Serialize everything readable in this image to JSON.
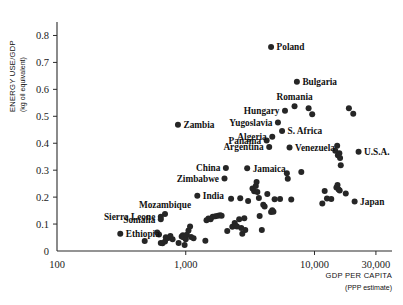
{
  "chart_data": {
    "type": "scatter",
    "title": "",
    "xlabel": "GDP PER CAPITA",
    "xlabel_sub": "(PPP estimate)",
    "ylabel": "ENERGY USE/GDP",
    "ylabel_sub": "(kg oil equivalent)",
    "xscale": "log",
    "yscale": "linear",
    "xlim": [
      100,
      40000
    ],
    "ylim": [
      0,
      0.85
    ],
    "grid": false,
    "legend": "none",
    "xticks": [
      {
        "value": 100,
        "label": "100"
      },
      {
        "value": 1000,
        "label": "1,000"
      },
      {
        "value": 10000,
        "label": "10,000"
      },
      {
        "value": 30000,
        "label": "30,000"
      }
    ],
    "yticks": [
      {
        "value": 0,
        "label": "0"
      },
      {
        "value": 0.1,
        "label": "0.1"
      },
      {
        "value": 0.2,
        "label": "0.2"
      },
      {
        "value": 0.3,
        "label": "0.3"
      },
      {
        "value": 0.4,
        "label": "0.4"
      },
      {
        "value": 0.5,
        "label": "0.5"
      },
      {
        "value": 0.6,
        "label": "0.6"
      },
      {
        "value": 0.7,
        "label": "0.7"
      },
      {
        "value": 0.8,
        "label": "0.8"
      }
    ],
    "marker_color": "#262626",
    "marker_size": 3.0,
    "labeled_points": [
      {
        "name": "Poland",
        "x": 4600,
        "y": 0.757,
        "label_side": "right"
      },
      {
        "name": "Bulgaria",
        "x": 7300,
        "y": 0.628,
        "label_side": "right"
      },
      {
        "name": "Romania",
        "x": 7000,
        "y": 0.537,
        "label_side": "above"
      },
      {
        "name": "Hungary",
        "x": 5900,
        "y": 0.521,
        "label_side": "left"
      },
      {
        "name": "Yugoslavia",
        "x": 5200,
        "y": 0.477,
        "label_side": "left"
      },
      {
        "name": "S. Africa",
        "x": 5600,
        "y": 0.445,
        "label_side": "right"
      },
      {
        "name": "Algeria",
        "x": 4700,
        "y": 0.424,
        "label_side": "left"
      },
      {
        "name": "Panama",
        "x": 4250,
        "y": 0.41,
        "label_side": "left"
      },
      {
        "name": "Argentina",
        "x": 4450,
        "y": 0.386,
        "label_side": "left"
      },
      {
        "name": "Venezuela",
        "x": 6400,
        "y": 0.384,
        "label_side": "right"
      },
      {
        "name": "U.S.A.",
        "x": 22000,
        "y": 0.368,
        "label_side": "right"
      },
      {
        "name": "Zambia",
        "x": 870,
        "y": 0.469,
        "label_side": "right"
      },
      {
        "name": "China",
        "x": 2050,
        "y": 0.308,
        "label_side": "left"
      },
      {
        "name": "Jamaica",
        "x": 3000,
        "y": 0.307,
        "label_side": "right"
      },
      {
        "name": "Zimbabwe",
        "x": 2000,
        "y": 0.269,
        "label_side": "left"
      },
      {
        "name": "India",
        "x": 1230,
        "y": 0.205,
        "label_side": "right"
      },
      {
        "name": "Japan",
        "x": 20500,
        "y": 0.184,
        "label_side": "right"
      },
      {
        "name": "Mozambique",
        "x": 690,
        "y": 0.137,
        "label_side": "above"
      },
      {
        "name": "Sierra Leone",
        "x": 640,
        "y": 0.127,
        "label_side": "left"
      },
      {
        "name": "Somalia",
        "x": 640,
        "y": 0.118,
        "label_side": "left"
      },
      {
        "name": "Ethiopia",
        "x": 310,
        "y": 0.064,
        "label_side": "right"
      }
    ],
    "unlabeled_points": [
      {
        "x": 480,
        "y": 0.037
      },
      {
        "x": 600,
        "y": 0.069
      },
      {
        "x": 620,
        "y": 0.061
      },
      {
        "x": 640,
        "y": 0.03
      },
      {
        "x": 660,
        "y": 0.029
      },
      {
        "x": 690,
        "y": 0.035
      },
      {
        "x": 700,
        "y": 0.051
      },
      {
        "x": 730,
        "y": 0.048
      },
      {
        "x": 760,
        "y": 0.056
      },
      {
        "x": 790,
        "y": 0.044
      },
      {
        "x": 880,
        "y": 0.03
      },
      {
        "x": 930,
        "y": 0.054
      },
      {
        "x": 950,
        "y": 0.058
      },
      {
        "x": 960,
        "y": 0.051
      },
      {
        "x": 980,
        "y": 0.022
      },
      {
        "x": 1000,
        "y": 0.044
      },
      {
        "x": 1020,
        "y": 0.06
      },
      {
        "x": 1050,
        "y": 0.076
      },
      {
        "x": 1080,
        "y": 0.091
      },
      {
        "x": 1100,
        "y": 0.052
      },
      {
        "x": 1150,
        "y": 0.047
      },
      {
        "x": 1420,
        "y": 0.038
      },
      {
        "x": 1450,
        "y": 0.114
      },
      {
        "x": 1500,
        "y": 0.121
      },
      {
        "x": 1560,
        "y": 0.118
      },
      {
        "x": 1620,
        "y": 0.127
      },
      {
        "x": 1700,
        "y": 0.129
      },
      {
        "x": 1780,
        "y": 0.131
      },
      {
        "x": 1850,
        "y": 0.133
      },
      {
        "x": 1900,
        "y": 0.131
      },
      {
        "x": 2100,
        "y": 0.074
      },
      {
        "x": 2250,
        "y": 0.194
      },
      {
        "x": 2300,
        "y": 0.09
      },
      {
        "x": 2400,
        "y": 0.104
      },
      {
        "x": 2450,
        "y": 0.093
      },
      {
        "x": 2500,
        "y": 0.091
      },
      {
        "x": 2600,
        "y": 0.118
      },
      {
        "x": 2650,
        "y": 0.196
      },
      {
        "x": 2700,
        "y": 0.085
      },
      {
        "x": 2750,
        "y": 0.064
      },
      {
        "x": 2850,
        "y": 0.122
      },
      {
        "x": 2900,
        "y": 0.078
      },
      {
        "x": 3050,
        "y": 0.186
      },
      {
        "x": 3300,
        "y": 0.232
      },
      {
        "x": 3400,
        "y": 0.222
      },
      {
        "x": 3500,
        "y": 0.241
      },
      {
        "x": 3550,
        "y": 0.256
      },
      {
        "x": 3600,
        "y": 0.219
      },
      {
        "x": 3700,
        "y": 0.197
      },
      {
        "x": 3750,
        "y": 0.13
      },
      {
        "x": 3900,
        "y": 0.078
      },
      {
        "x": 4000,
        "y": 0.172
      },
      {
        "x": 4100,
        "y": 0.165
      },
      {
        "x": 4300,
        "y": 0.212
      },
      {
        "x": 4600,
        "y": 0.145
      },
      {
        "x": 4700,
        "y": 0.151
      },
      {
        "x": 4800,
        "y": 0.146
      },
      {
        "x": 4900,
        "y": 0.192
      },
      {
        "x": 5400,
        "y": 0.193
      },
      {
        "x": 6100,
        "y": 0.289
      },
      {
        "x": 6200,
        "y": 0.268
      },
      {
        "x": 6600,
        "y": 0.191
      },
      {
        "x": 7900,
        "y": 0.293
      },
      {
        "x": 9000,
        "y": 0.53
      },
      {
        "x": 9600,
        "y": 0.508
      },
      {
        "x": 11500,
        "y": 0.176
      },
      {
        "x": 12000,
        "y": 0.223
      },
      {
        "x": 12500,
        "y": 0.195
      },
      {
        "x": 13500,
        "y": 0.193
      },
      {
        "x": 14500,
        "y": 0.372
      },
      {
        "x": 15000,
        "y": 0.391
      },
      {
        "x": 15200,
        "y": 0.355
      },
      {
        "x": 15600,
        "y": 0.363
      },
      {
        "x": 15800,
        "y": 0.345
      },
      {
        "x": 16000,
        "y": 0.318
      },
      {
        "x": 14800,
        "y": 0.236
      },
      {
        "x": 15100,
        "y": 0.245
      },
      {
        "x": 15400,
        "y": 0.228
      },
      {
        "x": 15700,
        "y": 0.225
      },
      {
        "x": 17500,
        "y": 0.213
      },
      {
        "x": 18500,
        "y": 0.53
      },
      {
        "x": 20000,
        "y": 0.509
      }
    ]
  }
}
